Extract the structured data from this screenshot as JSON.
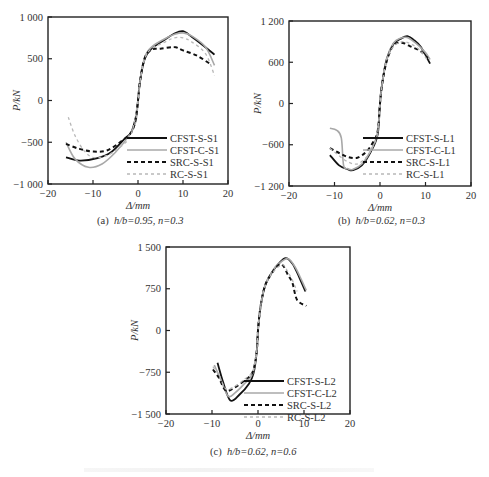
{
  "figure": {
    "captions": {
      "a": {
        "prefix": "(a)",
        "text": "h/b=0.95, n=0.3"
      },
      "b": {
        "prefix": "(b)",
        "text": "h/b=0.62, n=0.3"
      },
      "c": {
        "prefix": "(c)",
        "text": "h/b=0.62, n=0.6"
      }
    }
  },
  "chart_data": [
    {
      "id": "a",
      "type": "line",
      "title": "(a) h/b=0.95, n=0.3",
      "xlabel": "Δ/mm",
      "ylabel": "P/kN",
      "xlim": [
        -20,
        20
      ],
      "ylim": [
        -1000,
        1000
      ],
      "xticks": [
        -20,
        -10,
        0,
        10,
        20
      ],
      "yticks": [
        -1000,
        -500,
        0,
        500,
        1000
      ],
      "ytick_labels": [
        "−1 000",
        "−500",
        "0",
        "500",
        "1 000"
      ],
      "grid": false,
      "legend_position": "lower right",
      "series": [
        {
          "name": "CFST-S-S1",
          "style": "solid-black",
          "x": [
            -16,
            -13,
            -9,
            -6,
            -3,
            -1.5,
            -0.5,
            0,
            0.5,
            1.5,
            3,
            6,
            8,
            10,
            12,
            14,
            17
          ],
          "y": [
            -680,
            -720,
            -690,
            -620,
            -460,
            -380,
            -200,
            0,
            250,
            500,
            620,
            730,
            800,
            830,
            760,
            680,
            550
          ]
        },
        {
          "name": "CFST-C-S1",
          "style": "solid-gray",
          "x": [
            -16,
            -14,
            -11,
            -8,
            -5,
            -2,
            -0.5,
            0,
            0.5,
            1.5,
            3,
            6,
            8,
            10,
            12,
            15,
            17
          ],
          "y": [
            -500,
            -700,
            -800,
            -760,
            -620,
            -420,
            -250,
            0,
            250,
            520,
            640,
            740,
            790,
            810,
            770,
            640,
            420
          ]
        },
        {
          "name": "SRC-S-S1",
          "style": "dashed-black",
          "x": [
            -16,
            -13,
            -10,
            -7,
            -4,
            -1.5,
            -0.5,
            0,
            0.5,
            1.5,
            3,
            5,
            8,
            10,
            13,
            16
          ],
          "y": [
            -520,
            -580,
            -610,
            -600,
            -500,
            -380,
            -220,
            0,
            250,
            510,
            610,
            620,
            640,
            600,
            540,
            440
          ]
        },
        {
          "name": "RC-S-S1",
          "style": "dashed-gray",
          "x": [
            -15.5,
            -14,
            -12,
            -10,
            -7,
            -4,
            -1.5,
            0,
            0.5,
            1.5,
            3,
            6,
            8,
            10,
            12,
            15,
            17
          ],
          "y": [
            -200,
            -420,
            -600,
            -680,
            -660,
            -560,
            -400,
            0,
            250,
            500,
            620,
            700,
            750,
            750,
            700,
            560,
            300
          ]
        }
      ]
    },
    {
      "id": "b",
      "type": "line",
      "title": "(b) h/b=0.62, n=0.3",
      "xlabel": "Δ/mm",
      "ylabel": "P/kN",
      "xlim": [
        -20,
        20
      ],
      "ylim": [
        -1200,
        1200
      ],
      "xticks": [
        -20,
        -10,
        0,
        10,
        20
      ],
      "yticks": [
        -1200,
        -600,
        0,
        600,
        1200
      ],
      "ytick_labels": [
        "−1 200",
        "−600",
        "0",
        "600",
        "1 200"
      ],
      "grid": false,
      "legend_position": "lower right",
      "series": [
        {
          "name": "CFST-S-L1",
          "style": "solid-black",
          "x": [
            -11,
            -9,
            -7,
            -6,
            -4,
            -2,
            -0.5,
            0,
            0.5,
            1.5,
            3,
            4.5,
            6,
            7.5,
            9,
            11
          ],
          "y": [
            -750,
            -900,
            -960,
            -970,
            -900,
            -700,
            -450,
            0,
            300,
            650,
            870,
            940,
            980,
            920,
            820,
            580
          ]
        },
        {
          "name": "CFST-C-L1",
          "style": "solid-gray",
          "x": [
            -11,
            -9.5,
            -8.5,
            -8,
            -7,
            -6,
            -4,
            -2,
            -0.5,
            0,
            0.5,
            1.5,
            3,
            4.5,
            6,
            8,
            10,
            11
          ],
          "y": [
            -360,
            -390,
            -500,
            -900,
            -950,
            -960,
            -880,
            -680,
            -420,
            0,
            300,
            650,
            880,
            950,
            960,
            870,
            740,
            640
          ]
        },
        {
          "name": "SRC-S-L1",
          "style": "dashed-black",
          "x": [
            -11,
            -9,
            -7,
            -5,
            -3,
            -1.5,
            -0.5,
            0,
            0.5,
            1.5,
            3,
            5,
            7,
            9,
            10.5
          ],
          "y": [
            -650,
            -720,
            -780,
            -790,
            -700,
            -560,
            -400,
            0,
            300,
            620,
            850,
            880,
            820,
            760,
            660
          ]
        },
        {
          "name": "RC-S-L1",
          "style": "dashed-gray",
          "x": [
            -11,
            -9,
            -7,
            -5,
            -3,
            -1.5,
            -0.5,
            0,
            0.5,
            1.5,
            3,
            5,
            7,
            9,
            10.5
          ],
          "y": [
            -650,
            -760,
            -850,
            -880,
            -780,
            -620,
            -420,
            0,
            300,
            640,
            830,
            900,
            860,
            760,
            620
          ]
        }
      ]
    },
    {
      "id": "c",
      "type": "line",
      "title": "(c) h/b=0.62, n=0.6",
      "xlabel": "Δ/mm",
      "ylabel": "P/kN",
      "xlim": [
        -20,
        20
      ],
      "ylim": [
        -1500,
        1500
      ],
      "xticks": [
        -20,
        -10,
        0,
        10,
        20
      ],
      "yticks": [
        -1500,
        -750,
        0,
        750,
        1500
      ],
      "ytick_labels": [
        "−1 500",
        "−750",
        "0",
        "750",
        "1 500"
      ],
      "grid": false,
      "legend_position": "lower right",
      "series": [
        {
          "name": "CFST-S-L2",
          "style": "solid-black",
          "x": [
            -8.8,
            -7.5,
            -6,
            -4,
            -2,
            -1,
            -0.3,
            0,
            0.5,
            1.5,
            3,
            4.5,
            6,
            7.5,
            9,
            10.3
          ],
          "y": [
            -580,
            -950,
            -1260,
            -1150,
            -960,
            -780,
            -400,
            0,
            400,
            790,
            1040,
            1200,
            1300,
            1200,
            950,
            700
          ]
        },
        {
          "name": "CFST-C-L2",
          "style": "solid-gray",
          "x": [
            -9.5,
            -8,
            -6.5,
            -5,
            -3,
            -1.2,
            -0.3,
            0,
            0.5,
            1.5,
            3,
            4.5,
            6.5,
            8,
            9.5,
            10.5
          ],
          "y": [
            -620,
            -900,
            -1180,
            -1120,
            -960,
            -780,
            -400,
            0,
            400,
            800,
            1050,
            1200,
            1290,
            1150,
            900,
            720
          ]
        },
        {
          "name": "SRC-S-L2",
          "style": "dashed-black",
          "x": [
            -9.8,
            -8.5,
            -7,
            -5,
            -3,
            -1.2,
            -0.3,
            0,
            0.5,
            1.5,
            3,
            4.5,
            5.5,
            6.5,
            7.5,
            8.5,
            10.5
          ],
          "y": [
            -700,
            -850,
            -1080,
            -1020,
            -900,
            -750,
            -400,
            0,
            400,
            800,
            1030,
            1180,
            1160,
            1000,
            850,
            550,
            440
          ]
        },
        {
          "name": "RC-S-L2",
          "style": "dashed-gray",
          "x": [
            -9.8,
            -8.5,
            -7,
            -5,
            -3,
            -1.2,
            -0.3,
            0,
            0.5,
            1.5,
            3,
            4.5,
            5.5,
            6.5,
            7.5,
            8.5
          ],
          "y": [
            -650,
            -800,
            -1050,
            -1000,
            -880,
            -740,
            -400,
            0,
            400,
            790,
            1020,
            1150,
            1180,
            1050,
            900,
            700
          ]
        }
      ]
    }
  ]
}
